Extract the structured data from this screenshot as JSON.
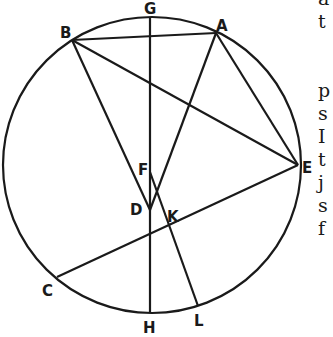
{
  "diagram": {
    "circle": {
      "cx": 152,
      "cy": 165,
      "r": 148
    },
    "stroke_color": "#1a1a1a",
    "points": {
      "G": {
        "x": 150,
        "y": 17,
        "label": "G",
        "lx": 144,
        "ly": 14
      },
      "A": {
        "x": 216,
        "y": 33,
        "label": "A",
        "lx": 216,
        "ly": 31
      },
      "B": {
        "x": 72,
        "y": 40,
        "label": "B",
        "lx": 60,
        "ly": 38
      },
      "E": {
        "x": 298,
        "y": 165,
        "label": "E",
        "lx": 302,
        "ly": 173
      },
      "C": {
        "x": 57,
        "y": 277,
        "label": "C",
        "lx": 42,
        "ly": 296
      },
      "H": {
        "x": 150,
        "y": 313,
        "label": "H",
        "lx": 143,
        "ly": 333
      },
      "L": {
        "x": 198,
        "y": 306,
        "label": "L",
        "lx": 194,
        "ly": 326
      },
      "D": {
        "x": 150,
        "y": 210,
        "label": "D",
        "lx": 130,
        "ly": 215
      },
      "K": {
        "x": 162,
        "y": 207,
        "label": "K",
        "lx": 167,
        "ly": 222
      },
      "F": {
        "x": 150,
        "y": 172,
        "label": "F",
        "lx": 138,
        "ly": 175
      }
    },
    "segments": [
      [
        "B",
        "A"
      ],
      [
        "G",
        "H"
      ],
      [
        "B",
        "D"
      ],
      [
        "B",
        "E"
      ],
      [
        "A",
        "D"
      ],
      [
        "A",
        "E"
      ],
      [
        "E",
        "C"
      ],
      [
        "F",
        "L"
      ]
    ]
  },
  "side_text": {
    "lines": [
      "a",
      "t",
      "",
      "p",
      "s",
      "I",
      "t",
      "j",
      "s",
      "f"
    ]
  }
}
